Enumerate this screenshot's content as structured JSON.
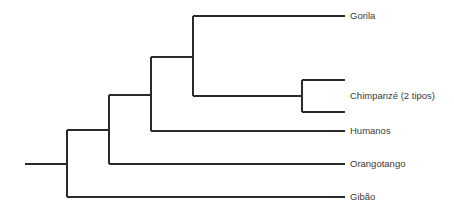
{
  "diagram": {
    "type": "phylogenetic-tree",
    "colors": {
      "line": "#2a2a2a",
      "label": "#3a3a3a",
      "background": "#ffffff"
    },
    "leaves": [
      {
        "id": "gorila",
        "label": "Gorila"
      },
      {
        "id": "chimpanze",
        "label": "Chimpanzé (2 tipos)"
      },
      {
        "id": "humanos",
        "label": "Humanos"
      },
      {
        "id": "orangotango",
        "label": "Orangotango"
      },
      {
        "id": "gibao",
        "label": "Gibão"
      }
    ],
    "topology": "((((Gorila,(Chimpanzé,Chimpanzé)),Humanos),Orangotango),Gibão)"
  }
}
